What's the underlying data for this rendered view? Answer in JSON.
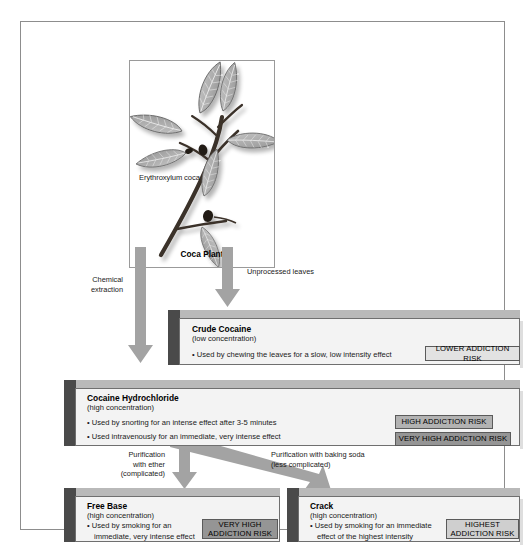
{
  "figure": {
    "plant_panel": {
      "species_label": "Erythroxylum coca",
      "caption": "Coca Plant",
      "image_name": "coca-plant-illustration"
    },
    "arrows": [
      {
        "name": "chemical-extraction",
        "label": "Chemical\nextraction"
      },
      {
        "name": "unprocessed-leaves",
        "label": "Unprocessed leaves"
      },
      {
        "name": "purification-ether",
        "label": "Purification\nwith ether\n(complicated)"
      },
      {
        "name": "purification-baking-soda",
        "label": "Purification with baking soda\n(less complicated)"
      }
    ],
    "boxes": [
      {
        "id": "crude",
        "title": "Crude Cocaine",
        "subtitle": "(low concentration)",
        "bullets": [
          "• Used by chewing the leaves for a slow, low intensity effect"
        ],
        "badge": {
          "label": "LOWER ADDICTION RISK",
          "style": "risk-lower",
          "fill": "#e2e2e2"
        }
      },
      {
        "id": "hydrochloride",
        "title": "Cocaine Hydrochloride",
        "subtitle": "(high concentration)",
        "bullets": [
          "• Used by snorting for an intense effect after 3-5 minutes",
          "• Used intravenously for an immediate, very intense effect"
        ],
        "badges": [
          {
            "label": "HIGH ADDICTION RISK",
            "style": "risk-high",
            "fill": "#b2b2b2"
          },
          {
            "label": "VERY HIGH ADDICTION RISK",
            "style": "risk-veryhigh",
            "fill": "#959595"
          }
        ]
      },
      {
        "id": "free-base",
        "title": "Free Base",
        "subtitle": "(high concentration)",
        "bullets": [
          "• Used by smoking for an immediate, very intense effect"
        ],
        "badge": {
          "label": "VERY HIGH ADDICTION RISK",
          "style": "risk-veryhigh",
          "fill": "#959595"
        }
      },
      {
        "id": "crack",
        "title": "Crack",
        "subtitle": "(high concentration)",
        "bullets": [
          "• Used by smoking for an immediate effect of the highest intensity"
        ],
        "badge": {
          "label": "HIGHEST ADDICTION RISK",
          "style": "risk-highest",
          "fill": "#cfcfcf"
        }
      }
    ],
    "colors": {
      "frame_border": "#8d8d8d",
      "arrow": "#a3a3a3",
      "box_front": "#f3f3f3",
      "box_left_face": "#4a4a4a",
      "box_top_face": "#b9b9b9"
    }
  }
}
